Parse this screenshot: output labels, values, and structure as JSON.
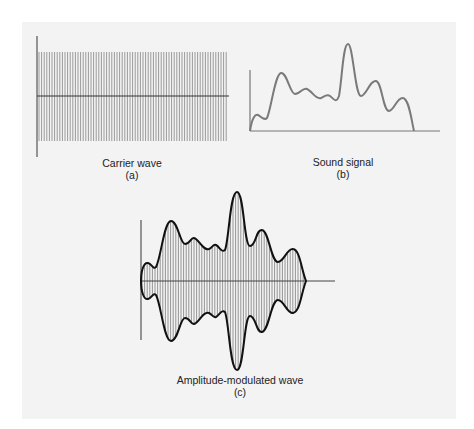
{
  "figure": {
    "panels": [
      {
        "id": "a",
        "caption": "Carrier wave",
        "letter": "(a)"
      },
      {
        "id": "b",
        "caption": "Sound signal",
        "letter": "(b)"
      },
      {
        "id": "c",
        "caption": "Amplitude-modulated wave",
        "letter": "(c)"
      }
    ],
    "colors": {
      "background": "#f3f3f3",
      "carrier_lines": "#9a9a9a",
      "axis": "#333333",
      "sound_curve": "#7a7a7a",
      "envelope": "#111111"
    }
  },
  "chart_data": [
    {
      "type": "line",
      "title": "Carrier wave (a)",
      "description": "Constant-amplitude high-frequency oscillation",
      "amplitude": "constant",
      "xlabel": "",
      "ylabel": ""
    },
    {
      "type": "line",
      "title": "Sound signal (b)",
      "x": [
        0,
        7,
        16,
        31,
        44,
        57,
        72,
        79,
        87,
        98,
        111,
        126,
        138,
        153,
        164
      ],
      "values": [
        0,
        16,
        12,
        58,
        37,
        42,
        32,
        36,
        30,
        87,
        35,
        50,
        20,
        33,
        0
      ],
      "xlabel": "",
      "ylabel": ""
    },
    {
      "type": "line",
      "title": "Amplitude-modulated wave (c)",
      "description": "Carrier whose envelope follows the sound signal, mirrored above and below the axis",
      "envelope_x": [
        0,
        7,
        14,
        30,
        43,
        52,
        68,
        74,
        83,
        96,
        108,
        121,
        137,
        152,
        165
      ],
      "envelope_values": [
        0,
        18,
        13,
        60,
        37,
        43,
        32,
        36,
        30,
        89,
        35,
        51,
        19,
        32,
        0
      ],
      "xlabel": "",
      "ylabel": ""
    }
  ]
}
